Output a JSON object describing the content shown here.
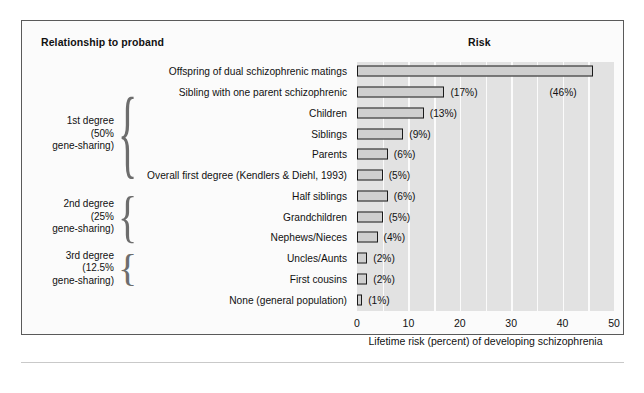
{
  "headers": {
    "left": "Relationship to proband",
    "right": "Risk"
  },
  "groups": [
    {
      "id": "first-degree",
      "lines": [
        "1st degree",
        "(50%",
        "gene-sharing)"
      ]
    },
    {
      "id": "second-degree",
      "lines": [
        "2nd degree",
        "(25%",
        "gene-sharing)"
      ]
    },
    {
      "id": "third-degree",
      "lines": [
        "3rd degree",
        "(12.5%",
        "gene-sharing)"
      ]
    }
  ],
  "axis": {
    "ticks": [
      "0",
      "10",
      "20",
      "30",
      "40",
      "50"
    ],
    "tick_values": [
      0,
      10,
      20,
      30,
      40,
      50
    ],
    "title": "Lifetime risk (percent) of developing schizophrenia",
    "min": 0,
    "max": 50,
    "gridline_step": 5
  },
  "colors": {
    "bar_fill": "#cfcfcf",
    "bar_outline": "#1a1a1a",
    "plot_background": "#e2e2e2",
    "gridline": "#fbfbfb",
    "frame": "#5a5a5a",
    "text": "#111111"
  },
  "chart_data": {
    "type": "bar",
    "orientation": "horizontal",
    "title": "Risk",
    "xlabel": "Lifetime risk (percent) of developing schizophrenia",
    "ylabel": "Relationship to proband",
    "xlim": [
      0,
      50
    ],
    "grid": true,
    "legend": "none",
    "categories": [
      "Offspring of dual schizophrenic matings",
      "Sibling with one parent schizophrenic",
      "Children",
      "Siblings",
      "Parents",
      "Overall first degree (Kendlers & Diehl, 1993)",
      "Half siblings",
      "Grandchildren",
      "Nephews/Nieces",
      "Uncles/Aunts",
      "First cousins",
      "None (general population)"
    ],
    "values": [
      46,
      17,
      13,
      9,
      6,
      5,
      6,
      5,
      4,
      2,
      2,
      1
    ],
    "value_labels": [
      "(46%)",
      "(17%)",
      "(13%)",
      "(9%)",
      "(6%)",
      "(5%)",
      "(6%)",
      "(5%)",
      "(4%)",
      "(2%)",
      "(2%)",
      "(1%)"
    ],
    "group_membership": [
      "none",
      "first-degree",
      "first-degree",
      "first-degree",
      "first-degree",
      "first-degree",
      "second-degree",
      "second-degree",
      "second-degree",
      "third-degree",
      "third-degree",
      "none"
    ]
  }
}
